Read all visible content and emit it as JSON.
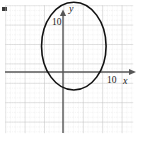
{
  "figure": {
    "title": "",
    "width": 143,
    "height": 143,
    "background_color": "#ffffff"
  },
  "axes": {
    "x_axis": {
      "label": "x",
      "arrow": true,
      "tick_label": "10",
      "color": "#555555"
    },
    "y_axis": {
      "label": "y",
      "arrow": true,
      "tick_label": "10",
      "color": "#555555"
    }
  },
  "grid": {
    "minor_color": "#d8d8d8",
    "major_color": "#c2c2c2",
    "minor_spacing_px": 4.85,
    "major_spacing_px": 19.4,
    "style": "dotted"
  },
  "curve": {
    "name": "ellipse",
    "color": "#111111",
    "stroke_width": 1.6
  },
  "chart_data": {
    "type": "scatter",
    "title": "",
    "xlabel": "x",
    "ylabel": "y",
    "xlim": [
      -13,
      18
    ],
    "ylim": [
      -16,
      15
    ],
    "x_ticks": [
      10
    ],
    "x_tick_labels": [
      "10"
    ],
    "y_ticks": [
      10
    ],
    "y_tick_labels": [
      "10"
    ],
    "grid": true,
    "legend": "none",
    "series": [
      {
        "name": "ellipse",
        "kind": "conic",
        "center": [
          3,
          5
        ],
        "semi_axis_x": 7,
        "semi_axis_y": 9.5,
        "equation": "(x-3)^2/49 + (y-5)^2/90.25 = 1",
        "closed": true
      }
    ],
    "annotations": []
  }
}
